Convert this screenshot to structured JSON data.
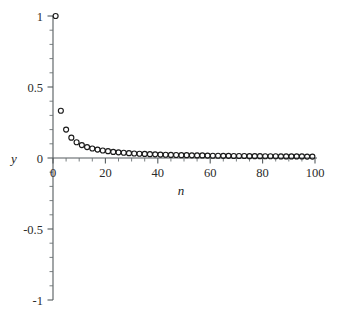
{
  "figure": {
    "background_color": "#ffffff",
    "axis_color": "#555b5e",
    "marker_color": "#1a1a1a",
    "width": 339,
    "height": 316
  },
  "chart_data": {
    "type": "scatter",
    "title": "",
    "subtitle": "",
    "xlabel": "n",
    "ylabel": "y",
    "xlim": [
      0,
      100
    ],
    "ylim": [
      -1,
      1
    ],
    "grid": false,
    "legend": null,
    "marker": "open-circle",
    "x_ticks": [
      0,
      20,
      40,
      60,
      80,
      100
    ],
    "x_tick_labels": [
      "0",
      "20",
      "40",
      "60",
      "80",
      "100"
    ],
    "x_minor_tick_step": 5,
    "y_ticks": [
      -1,
      -0.5,
      0,
      0.5,
      1
    ],
    "y_tick_labels": [
      "-1",
      "-0.5",
      "0",
      "0.5",
      "1"
    ],
    "y_minor_tick_step": 0.1,
    "series": [
      {
        "name": "y = 1/n",
        "x": [
          1,
          3,
          5,
          7,
          9,
          11,
          13,
          15,
          17,
          19,
          21,
          23,
          25,
          27,
          29,
          31,
          33,
          35,
          37,
          39,
          41,
          43,
          45,
          47,
          49,
          51,
          53,
          55,
          57,
          59,
          61,
          63,
          65,
          67,
          69,
          71,
          73,
          75,
          77,
          79,
          81,
          83,
          85,
          87,
          89,
          91,
          93,
          95,
          97,
          99
        ],
        "y": [
          1,
          0.333,
          0.2,
          0.143,
          0.111,
          0.091,
          0.077,
          0.067,
          0.059,
          0.053,
          0.048,
          0.043,
          0.04,
          0.037,
          0.034,
          0.032,
          0.03,
          0.029,
          0.027,
          0.026,
          0.024,
          0.023,
          0.022,
          0.021,
          0.02,
          0.02,
          0.019,
          0.018,
          0.018,
          0.017,
          0.016,
          0.016,
          0.015,
          0.015,
          0.014,
          0.014,
          0.014,
          0.013,
          0.013,
          0.013,
          0.012,
          0.012,
          0.012,
          0.011,
          0.011,
          0.011,
          0.011,
          0.011,
          0.01,
          0.01
        ]
      }
    ]
  }
}
